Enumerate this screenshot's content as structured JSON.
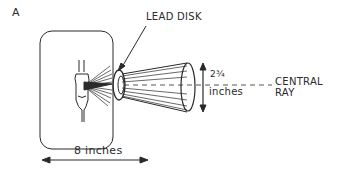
{
  "figure": {
    "panel_label": "A",
    "labels": {
      "lead_disk": "LEAD DISK",
      "diameter_value": "2¾",
      "diameter_unit": "inches",
      "central_ray_line1": "CENTRAL",
      "central_ray_line2": "RAY",
      "distance": "8 inches"
    },
    "colors": {
      "ink": "#2a2a2a",
      "background": "#ffffff"
    }
  }
}
